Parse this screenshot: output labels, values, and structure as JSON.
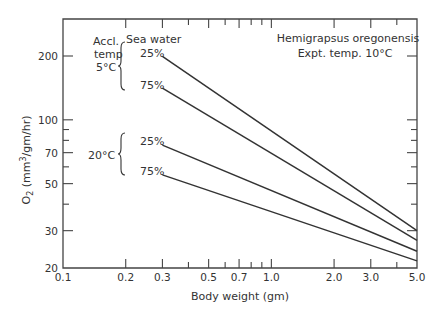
{
  "chart_data": {
    "type": "line",
    "title": "Hemigrapsus oregonensis",
    "subtitle": "Expt. temp. 10°C",
    "xlabel": "Body weight (gm)",
    "ylabel": "O2 (mm3/gm/hr)",
    "xscale": "log",
    "yscale": "log",
    "xlim": [
      0.1,
      5.0
    ],
    "ylim": [
      20,
      300
    ],
    "x_ticks": [
      "0.1",
      "0.2",
      "0.3",
      "0.5",
      "0.7",
      "1.0",
      "2.0",
      "3.0",
      "5.0"
    ],
    "y_ticks": [
      "20",
      "30",
      "50",
      "70",
      "100",
      "200"
    ],
    "grid": false,
    "legend_header": "Sea water",
    "groups": [
      {
        "label": "Accl. temp 5°C",
        "lines": [
          "25%",
          "75%"
        ]
      },
      {
        "label": "20°C",
        "lines": [
          "25%",
          "75%"
        ]
      }
    ],
    "series": [
      {
        "name": "Accl. 5°C, 25% sea water",
        "x": [
          0.3,
          5.0
        ],
        "values": [
          199,
          30
        ]
      },
      {
        "name": "Accl. 5°C, 75% sea water",
        "x": [
          0.3,
          5.0
        ],
        "values": [
          141,
          27
        ]
      },
      {
        "name": "Accl. 20°C, 25% sea water",
        "x": [
          0.3,
          5.0
        ],
        "values": [
          76,
          24
        ]
      },
      {
        "name": "Accl. 20°C, 75% sea water",
        "x": [
          0.3,
          5.0
        ],
        "values": [
          55,
          21.6
        ]
      }
    ]
  },
  "labels": {
    "title": "Hemigrapsus  oregonensis",
    "subtitle": "Expt. temp. 10°C",
    "xlabel": "Body weight (gm)",
    "ylabel_main": "O",
    "ylabel_sub": "2",
    "ylabel_rest": " (mm",
    "ylabel_sup": "3",
    "ylabel_end": "/gm/hr)",
    "sea_water": "Sea water",
    "accl": "Accl.",
    "temp": "temp",
    "temp5": "5°C",
    "temp20": "20°C",
    "s1": "25%",
    "s2": "75%",
    "s3": "25%",
    "s4": "75%"
  }
}
